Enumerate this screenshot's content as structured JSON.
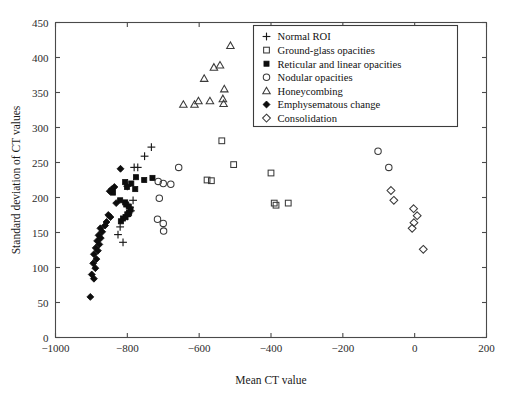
{
  "figure": {
    "background_color": "#ffffff",
    "marker_color": "#0d0d0d",
    "axis_color": "#4a4a4a"
  },
  "chart_data": {
    "type": "scatter",
    "title": "",
    "xlabel": "Mean CT value",
    "ylabel": "Standard deviation of CT values",
    "xlim": [
      -1000,
      200
    ],
    "ylim": [
      0,
      450
    ],
    "xticks": [
      -1000,
      -800,
      -600,
      -400,
      -200,
      0,
      200
    ],
    "xtick_labels": [
      "−1000",
      "−800",
      "−600",
      "−400",
      "−200",
      "0",
      "200"
    ],
    "yticks": [
      0,
      50,
      100,
      150,
      200,
      250,
      300,
      350,
      400,
      450
    ],
    "ytick_labels": [
      "0",
      "50",
      "100",
      "150",
      "200",
      "250",
      "300",
      "350",
      "400",
      "450"
    ],
    "grid": false,
    "legend_position": "upper right",
    "series": [
      {
        "name": "Normal ROI",
        "marker": "plus",
        "filled": false,
        "points": [
          [
            -733,
            272
          ],
          [
            -752,
            259
          ],
          [
            -781,
            243
          ],
          [
            -771,
            243
          ],
          [
            -800,
            216
          ],
          [
            -784,
            196
          ],
          [
            -793,
            186
          ],
          [
            -790,
            181
          ],
          [
            -796,
            178
          ],
          [
            -800,
            173
          ],
          [
            -820,
            158
          ],
          [
            -826,
            147
          ],
          [
            -812,
            136
          ]
        ]
      },
      {
        "name": "Ground-glass opacities",
        "marker": "square",
        "filled": false,
        "points": [
          [
            -537,
            281
          ],
          [
            -504,
            247
          ],
          [
            -578,
            225
          ],
          [
            -566,
            224
          ],
          [
            -400,
            235
          ],
          [
            -391,
            192
          ],
          [
            -386,
            189
          ],
          [
            -352,
            192
          ]
        ]
      },
      {
        "name": "Reticular and linear opacities",
        "marker": "square",
        "filled": true,
        "points": [
          [
            -776,
            229
          ],
          [
            -753,
            225
          ],
          [
            -730,
            228
          ],
          [
            -789,
            220
          ],
          [
            -806,
            222
          ],
          [
            -801,
            215
          ],
          [
            -778,
            212
          ],
          [
            -840,
            207
          ],
          [
            -820,
            196
          ],
          [
            -806,
            193
          ],
          [
            -803,
            190
          ],
          [
            -796,
            187
          ],
          [
            -791,
            183
          ],
          [
            -795,
            178
          ],
          [
            -800,
            176
          ],
          [
            -805,
            172
          ],
          [
            -812,
            170
          ],
          [
            -818,
            166
          ]
        ]
      },
      {
        "name": "Nodular opacities",
        "marker": "circle",
        "filled": false,
        "points": [
          [
            -657,
            243
          ],
          [
            -714,
            223
          ],
          [
            -700,
            220
          ],
          [
            -679,
            219
          ],
          [
            -711,
            199
          ],
          [
            -716,
            169
          ],
          [
            -700,
            163
          ],
          [
            -699,
            152
          ],
          [
            -102,
            266
          ],
          [
            -72,
            243
          ]
        ]
      },
      {
        "name": "Honeycombing",
        "marker": "triangle",
        "filled": false,
        "points": [
          [
            -513,
            417
          ],
          [
            -542,
            389
          ],
          [
            -559,
            386
          ],
          [
            -586,
            370
          ],
          [
            -530,
            355
          ],
          [
            -602,
            338
          ],
          [
            -570,
            338
          ],
          [
            -534,
            341
          ],
          [
            -532,
            334
          ],
          [
            -644,
            333
          ],
          [
            -613,
            333
          ]
        ]
      },
      {
        "name": "Emphysematous change",
        "marker": "diamond",
        "filled": true,
        "points": [
          [
            -836,
            215
          ],
          [
            -843,
            212
          ],
          [
            -849,
            209
          ],
          [
            -831,
            192
          ],
          [
            -853,
            175
          ],
          [
            -847,
            172
          ],
          [
            -858,
            165
          ],
          [
            -862,
            160
          ],
          [
            -875,
            156
          ],
          [
            -870,
            151
          ],
          [
            -880,
            146
          ],
          [
            -874,
            142
          ],
          [
            -884,
            138
          ],
          [
            -878,
            133
          ],
          [
            -888,
            128
          ],
          [
            -882,
            124
          ],
          [
            -893,
            119
          ],
          [
            -886,
            112
          ],
          [
            -895,
            106
          ],
          [
            -889,
            99
          ],
          [
            -899,
            90
          ],
          [
            -893,
            84
          ],
          [
            -903,
            58
          ],
          [
            -819,
            241
          ]
        ]
      },
      {
        "name": "Consolidation",
        "marker": "diamond",
        "filled": false,
        "points": [
          [
            -66,
            210
          ],
          [
            -58,
            196
          ],
          [
            -3,
            184
          ],
          [
            7,
            174
          ],
          [
            -2,
            164
          ],
          [
            -7,
            156
          ],
          [
            24,
            126
          ]
        ]
      }
    ]
  },
  "legend": {
    "entries": [
      {
        "label": "Normal ROI",
        "marker": "plus"
      },
      {
        "label": "Ground-glass opacities",
        "marker": "square-open"
      },
      {
        "label": "Reticular and linear opacities",
        "marker": "square-filled"
      },
      {
        "label": "Nodular opacities",
        "marker": "circle-open"
      },
      {
        "label": "Honeycombing",
        "marker": "triangle-open"
      },
      {
        "label": "Emphysematous change",
        "marker": "diamond-filled"
      },
      {
        "label": "Consolidation",
        "marker": "diamond-open"
      }
    ]
  }
}
